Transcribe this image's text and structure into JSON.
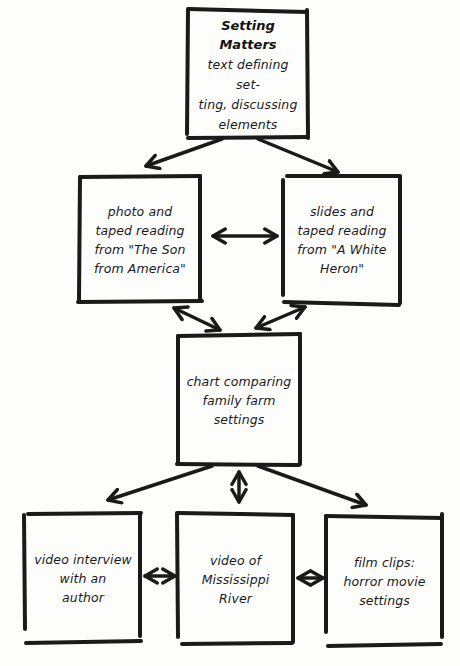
{
  "diagram": {
    "type": "concept-map",
    "style": {
      "stroke_color": "#1a1a1a",
      "background": "#fdfdfc"
    },
    "nodes": {
      "setting_matters": {
        "title": "Setting Matters",
        "text": "text defining set-\nting, discussing\nelements"
      },
      "son_from_america": {
        "text": "photo and\ntaped reading\nfrom \"The Son\nfrom America\""
      },
      "white_heron": {
        "text": "slides and\ntaped reading\nfrom \"A White\nHeron\""
      },
      "family_farm_chart": {
        "text": "chart comparing\nfamily farm\nsettings"
      },
      "author_interview": {
        "text": "video interview\nwith an\nauthor"
      },
      "mississippi_river": {
        "text": "video of\nMississippi\nRiver"
      },
      "horror_film_clips": {
        "text": "film clips:\nhorror movie\nsettings"
      }
    },
    "edges": [
      {
        "from": "setting_matters",
        "to": "son_from_america",
        "direction": "one-way"
      },
      {
        "from": "setting_matters",
        "to": "white_heron",
        "direction": "one-way"
      },
      {
        "from": "son_from_america",
        "to": "white_heron",
        "direction": "two-way"
      },
      {
        "from": "son_from_america",
        "to": "family_farm_chart",
        "direction": "two-way"
      },
      {
        "from": "white_heron",
        "to": "family_farm_chart",
        "direction": "two-way"
      },
      {
        "from": "family_farm_chart",
        "to": "author_interview",
        "direction": "one-way"
      },
      {
        "from": "family_farm_chart",
        "to": "mississippi_river",
        "direction": "two-way"
      },
      {
        "from": "family_farm_chart",
        "to": "horror_film_clips",
        "direction": "one-way"
      },
      {
        "from": "author_interview",
        "to": "mississippi_river",
        "direction": "two-way"
      },
      {
        "from": "mississippi_river",
        "to": "horror_film_clips",
        "direction": "two-way"
      }
    ]
  }
}
